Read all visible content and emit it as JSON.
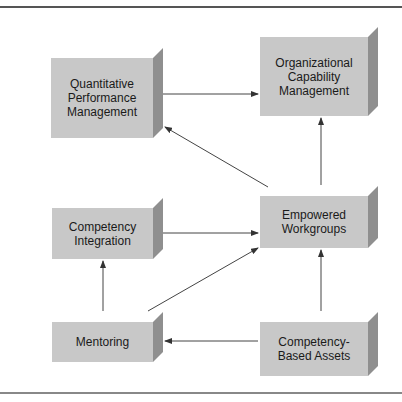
{
  "diagram": {
    "colors": {
      "front": "#c8c8c8",
      "side": "#8f8f8f",
      "top": "#d8d8d8",
      "line": "#444444",
      "rule": "#555555"
    },
    "nodes": [
      {
        "id": "qpm",
        "label": "Quantitative\nPerformance\nManagement",
        "x": 51,
        "y": 58,
        "w": 102,
        "h": 80
      },
      {
        "id": "ocm",
        "label": "Organizational\nCapability\nManagement",
        "x": 260,
        "y": 37,
        "w": 108,
        "h": 79
      },
      {
        "id": "ci",
        "label": "Competency\nIntegration",
        "x": 52,
        "y": 208,
        "w": 101,
        "h": 51
      },
      {
        "id": "ew",
        "label": "Empowered\nWorkgroups",
        "x": 260,
        "y": 196,
        "w": 108,
        "h": 52
      },
      {
        "id": "mentoring",
        "label": "Mentoring",
        "x": 52,
        "y": 322,
        "w": 101,
        "h": 40
      },
      {
        "id": "cba",
        "label": "Competency-\nBased Assets",
        "x": 260,
        "y": 322,
        "w": 108,
        "h": 54
      }
    ],
    "edges": [
      {
        "from": "qpm",
        "to": "ocm"
      },
      {
        "from": "ew",
        "to": "ocm"
      },
      {
        "from": "ew",
        "to": "qpm"
      },
      {
        "from": "ci",
        "to": "ew"
      },
      {
        "from": "mentoring",
        "to": "ci"
      },
      {
        "from": "mentoring",
        "to": "ew"
      },
      {
        "from": "cba",
        "to": "ew"
      },
      {
        "from": "cba",
        "to": "mentoring"
      }
    ]
  }
}
